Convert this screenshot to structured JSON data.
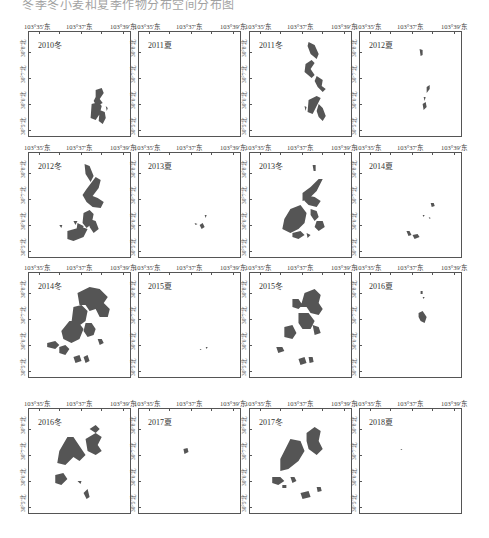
{
  "caption": "冬季冬小麦和夏季作物分布空间分布图",
  "axes": {
    "lon_labels": [
      "103°35′东",
      "103°37′东",
      "103°39′东"
    ],
    "lat_labels": [
      "30°8′北",
      "30°7′北",
      "30°6′北",
      "30°5′北"
    ]
  },
  "colors": {
    "crop_fill": "#555555",
    "frame": "#555555",
    "background": "#ffffff"
  },
  "panels": [
    {
      "title": "2010冬",
      "season": "winter",
      "year": 2010
    },
    {
      "title": "2011夏",
      "season": "summer",
      "year": 2011
    },
    {
      "title": "2011冬",
      "season": "winter",
      "year": 2011
    },
    {
      "title": "2012夏",
      "season": "summer",
      "year": 2012
    },
    {
      "title": "2012冬",
      "season": "winter",
      "year": 2012
    },
    {
      "title": "2013夏",
      "season": "summer",
      "year": 2013
    },
    {
      "title": "2013冬",
      "season": "winter",
      "year": 2013
    },
    {
      "title": "2014夏",
      "season": "summer",
      "year": 2014
    },
    {
      "title": "2014冬",
      "season": "winter",
      "year": 2014
    },
    {
      "title": "2015夏",
      "season": "summer",
      "year": 2015
    },
    {
      "title": "2015冬",
      "season": "winter",
      "year": 2015
    },
    {
      "title": "2016夏",
      "season": "summer",
      "year": 2016
    },
    {
      "title": "2016冬",
      "season": "winter",
      "year": 2016
    },
    {
      "title": "2017夏",
      "season": "summer",
      "year": 2017
    },
    {
      "title": "2017冬",
      "season": "winter",
      "year": 2017
    },
    {
      "title": "2018夏",
      "season": "summer",
      "year": 2018
    }
  ]
}
